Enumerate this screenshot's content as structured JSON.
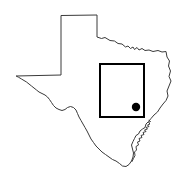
{
  "figure": {
    "kind": "map-figure",
    "width": 190,
    "height": 178,
    "background_color": "#ffffff",
    "title": "",
    "caption": ""
  },
  "map": {
    "region_name": "Texas",
    "outline_label": "texas-state-outline",
    "outline_stroke_color": "#3a3a3a",
    "outline_fill_color": "#ffffff",
    "outline_stroke_width": 1,
    "outline_path": "M 16.5,76.0 L 61.0,75.0 L 61.0,15.5 L 97.0,15.0 L 97.0,37.0 L 101.5,38.5 L 105.0,37.5 L 110.0,40.5 L 114.5,41.0 L 118.0,43.5 L 122.0,44.0 L 125.5,47.0 L 128.0,46.0 L 130.5,48.5 L 133.0,47.0 L 134.5,49.5 L 137.0,47.5 L 139.0,50.0 L 142.0,48.5 L 145.0,50.5 L 149.0,50.0 L 153.0,51.5 L 158.0,50.5 L 162.0,52.0 L 166.0,51.5 L 167.0,57.0 L 169.5,61.0 L 168.5,66.0 L 170.5,71.0 L 169.0,76.5 L 171.0,81.0 L 169.0,86.0 L 167.0,91.0 L 168.0,96.0 L 166.0,100.5 L 163.0,104.0 L 160.0,108.0 L 157.5,112.0 L 154.0,115.0 L 151.0,118.5 L 148.5,121.5 L 146.0,124.0 L 145.0,127.5 L 142.5,129.0 L 140.0,131.0 L 138.5,134.0 L 136.0,135.5 L 134.5,138.5 L 133.0,141.5 L 131.5,145.0 L 132.5,149.0 L 133.5,153.0 L 133.0,157.0 L 131.5,161.0 L 129.0,164.5 L 126.0,166.5 L 122.5,166.0 L 119.5,163.5 L 116.0,161.0 L 112.5,159.5 L 109.0,157.0 L 105.5,154.5 L 102.0,152.0 L 99.0,149.0 L 96.0,146.0 L 93.5,142.5 L 91.0,139.0 L 89.0,135.0 L 87.0,131.0 L 85.0,127.5 L 83.0,124.0 L 81.0,120.5 L 79.0,117.0 L 77.5,113.5 L 76.0,110.0 L 73.5,107.5 L 70.5,106.5 L 67.5,107.5 L 65.0,109.5 L 62.0,110.5 L 59.0,109.5 L 56.0,108.0 L 53.5,105.5 L 51.5,102.5 L 49.5,99.5 L 47.5,97.0 L 45.0,95.0 L 42.0,93.5 L 39.0,92.0 L 36.5,90.0 L 34.0,88.0 L 31.5,86.0 L 29.0,84.0 L 26.5,82.0 L 24.0,80.5 L 21.5,79.0 L 19.0,77.5 Z",
    "coast_detail_path": "M 149.0,120.5 L 150.5,121.5 L 148.5,122.5 L 150.0,124.0 L 147.5,125.0 L 149.0,126.5 L 146.0,127.5 L 147.5,129.0 L 144.5,130.0 L 146.0,131.5 L 143.0,132.5 L 144.0,134.5 L 141.0,135.5 L 142.0,137.5 L 139.0,138.5 L 140.0,141.0 L 137.5,142.0 L 138.5,145.0 L 136.0,146.5 L 136.5,150.0 L 134.5,152.0 L 135.0,155.5 L 133.5,158.5 L 132.0,161.5"
  },
  "study_area": {
    "label": "study-area-box",
    "shape": "square",
    "stroke_color": "#000000",
    "stroke_width": 2,
    "fill": "none",
    "x": 100,
    "y": 64,
    "width": 44,
    "height": 53
  },
  "site_marker": {
    "label": "site-location-dot",
    "shape": "filled-circle",
    "fill_color": "#000000",
    "center_x": 136,
    "center_y": 107,
    "radius": 4.2
  }
}
